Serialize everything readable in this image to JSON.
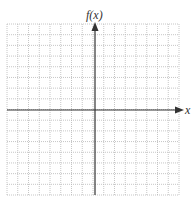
{
  "graph": {
    "y_axis_label": "f(x)",
    "x_axis_label": "x",
    "grid": {
      "columns": 16,
      "rows": 16,
      "style": "dotted"
    },
    "colors": {
      "grid": "#b8b8b8",
      "axis": "#333333",
      "background": "#ffffff"
    }
  }
}
